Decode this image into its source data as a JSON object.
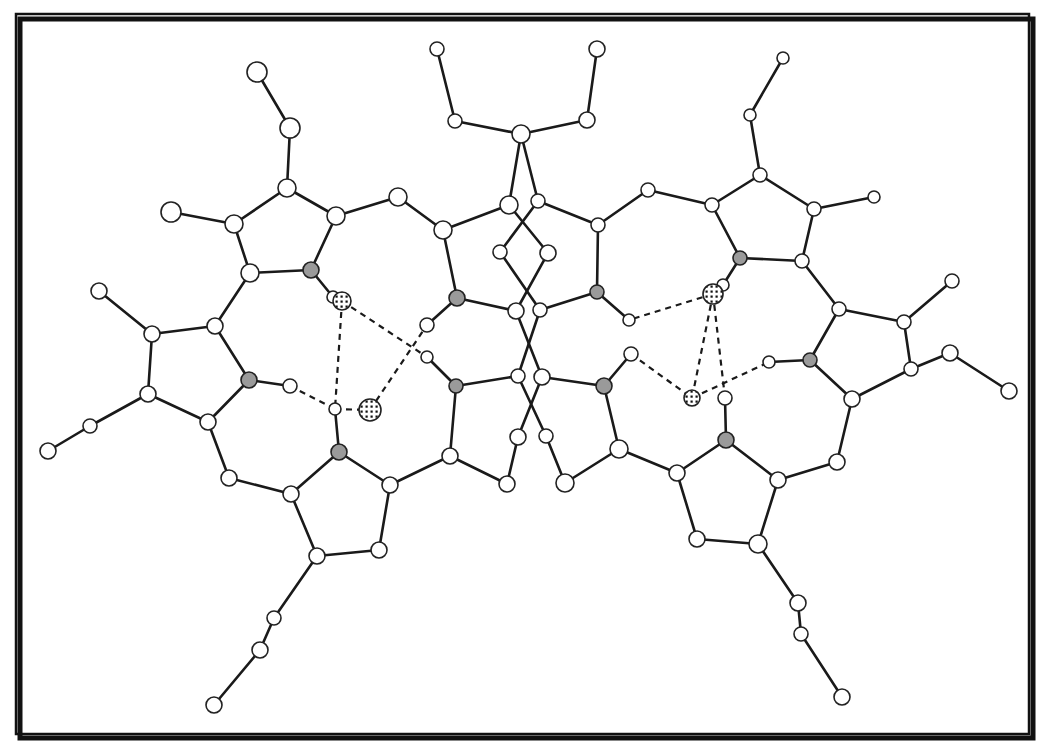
{
  "figure": {
    "title": "",
    "colors": {
      "bond": "#1a1a1a",
      "carbon_fill": "#ffffff",
      "nitrogen_fill": "#9a9a9a",
      "frame": "#111111"
    },
    "legend": {
      "carbon": "open circle",
      "nitrogen": "gray filled circle",
      "hydrogen": "small open circle",
      "oxygen": "stippled circle",
      "hydrogen_bond": "dashed line"
    }
  },
  "atoms": [
    {
      "id": "a1",
      "x": 257,
      "y": 72,
      "r": 10,
      "type": "c"
    },
    {
      "id": "a2",
      "x": 290,
      "y": 128,
      "r": 10,
      "type": "c"
    },
    {
      "id": "a3",
      "x": 287,
      "y": 188,
      "r": 9,
      "type": "c"
    },
    {
      "id": "a4",
      "x": 171,
      "y": 212,
      "r": 10,
      "type": "c"
    },
    {
      "id": "a5",
      "x": 234,
      "y": 224,
      "r": 9,
      "type": "c"
    },
    {
      "id": "a6",
      "x": 336,
      "y": 216,
      "r": 9,
      "type": "c"
    },
    {
      "id": "a7",
      "x": 250,
      "y": 273,
      "r": 9,
      "type": "c"
    },
    {
      "id": "a8",
      "x": 311,
      "y": 270,
      "r": 8,
      "type": "n"
    },
    {
      "id": "a9",
      "x": 398,
      "y": 197,
      "r": 9,
      "type": "c"
    },
    {
      "id": "a10",
      "x": 443,
      "y": 230,
      "r": 9,
      "type": "c"
    },
    {
      "id": "a11",
      "x": 99,
      "y": 291,
      "r": 8,
      "type": "c"
    },
    {
      "id": "a12",
      "x": 215,
      "y": 326,
      "r": 8,
      "type": "c"
    },
    {
      "id": "a13",
      "x": 152,
      "y": 334,
      "r": 8,
      "type": "c"
    },
    {
      "id": "a14",
      "x": 249,
      "y": 380,
      "r": 8,
      "type": "n"
    },
    {
      "id": "a15",
      "x": 148,
      "y": 394,
      "r": 8,
      "type": "c"
    },
    {
      "id": "a16",
      "x": 290,
      "y": 386,
      "r": 7,
      "type": "h"
    },
    {
      "id": "a17",
      "x": 208,
      "y": 422,
      "r": 8,
      "type": "c"
    },
    {
      "id": "a18",
      "x": 90,
      "y": 426,
      "r": 7,
      "type": "c"
    },
    {
      "id": "a19",
      "x": 48,
      "y": 451,
      "r": 8,
      "type": "c"
    },
    {
      "id": "a20",
      "x": 229,
      "y": 478,
      "r": 8,
      "type": "c"
    },
    {
      "id": "a21",
      "x": 291,
      "y": 494,
      "r": 8,
      "type": "c"
    },
    {
      "id": "a22",
      "x": 339,
      "y": 452,
      "r": 8,
      "type": "n"
    },
    {
      "id": "a23",
      "x": 390,
      "y": 485,
      "r": 8,
      "type": "c"
    },
    {
      "id": "a24",
      "x": 317,
      "y": 556,
      "r": 8,
      "type": "c"
    },
    {
      "id": "a25",
      "x": 379,
      "y": 550,
      "r": 8,
      "type": "c"
    },
    {
      "id": "a26",
      "x": 274,
      "y": 618,
      "r": 7,
      "type": "c"
    },
    {
      "id": "a27",
      "x": 260,
      "y": 650,
      "r": 8,
      "type": "c"
    },
    {
      "id": "a28",
      "x": 214,
      "y": 705,
      "r": 8,
      "type": "c"
    },
    {
      "id": "a29",
      "x": 333,
      "y": 297,
      "r": 6,
      "type": "h"
    },
    {
      "id": "a30",
      "x": 342,
      "y": 301,
      "r": 9,
      "type": "x"
    },
    {
      "id": "a31",
      "x": 335,
      "y": 409,
      "r": 6,
      "type": "h"
    },
    {
      "id": "a32",
      "x": 370,
      "y": 410,
      "r": 11,
      "type": "x"
    },
    {
      "id": "a33",
      "x": 427,
      "y": 325,
      "r": 7,
      "type": "h"
    },
    {
      "id": "a34",
      "x": 427,
      "y": 357,
      "r": 6,
      "type": "h"
    },
    {
      "id": "a35",
      "x": 457,
      "y": 298,
      "r": 8,
      "type": "n"
    },
    {
      "id": "a36",
      "x": 456,
      "y": 386,
      "r": 7,
      "type": "n"
    },
    {
      "id": "a37",
      "x": 450,
      "y": 456,
      "r": 8,
      "type": "c"
    },
    {
      "id": "a38",
      "x": 507,
      "y": 484,
      "r": 8,
      "type": "c"
    },
    {
      "id": "a39",
      "x": 437,
      "y": 49,
      "r": 7,
      "type": "c"
    },
    {
      "id": "a40",
      "x": 455,
      "y": 121,
      "r": 7,
      "type": "c"
    },
    {
      "id": "a41",
      "x": 521,
      "y": 134,
      "r": 9,
      "type": "c"
    },
    {
      "id": "a42",
      "x": 587,
      "y": 120,
      "r": 8,
      "type": "c"
    },
    {
      "id": "a43",
      "x": 597,
      "y": 49,
      "r": 8,
      "type": "c"
    },
    {
      "id": "a44",
      "x": 509,
      "y": 205,
      "r": 9,
      "type": "c"
    },
    {
      "id": "a45",
      "x": 538,
      "y": 201,
      "r": 7,
      "type": "c"
    },
    {
      "id": "a46",
      "x": 500,
      "y": 252,
      "r": 7,
      "type": "c"
    },
    {
      "id": "a47",
      "x": 548,
      "y": 253,
      "r": 8,
      "type": "c"
    },
    {
      "id": "a48",
      "x": 516,
      "y": 311,
      "r": 8,
      "type": "c"
    },
    {
      "id": "a49",
      "x": 540,
      "y": 310,
      "r": 7,
      "type": "c"
    },
    {
      "id": "a50",
      "x": 518,
      "y": 376,
      "r": 7,
      "type": "c"
    },
    {
      "id": "a51",
      "x": 542,
      "y": 377,
      "r": 8,
      "type": "c"
    },
    {
      "id": "a52",
      "x": 518,
      "y": 437,
      "r": 8,
      "type": "c"
    },
    {
      "id": "a53",
      "x": 546,
      "y": 436,
      "r": 7,
      "type": "c"
    },
    {
      "id": "a54",
      "x": 565,
      "y": 483,
      "r": 9,
      "type": "c"
    },
    {
      "id": "a55",
      "x": 598,
      "y": 225,
      "r": 7,
      "type": "c"
    },
    {
      "id": "a56",
      "x": 597,
      "y": 292,
      "r": 7,
      "type": "n"
    },
    {
      "id": "a57",
      "x": 629,
      "y": 320,
      "r": 6,
      "type": "h"
    },
    {
      "id": "a58",
      "x": 604,
      "y": 386,
      "r": 8,
      "type": "n"
    },
    {
      "id": "a59",
      "x": 631,
      "y": 354,
      "r": 7,
      "type": "h"
    },
    {
      "id": "a60",
      "x": 619,
      "y": 449,
      "r": 9,
      "type": "c"
    },
    {
      "id": "a61",
      "x": 648,
      "y": 190,
      "r": 7,
      "type": "c"
    },
    {
      "id": "a62",
      "x": 712,
      "y": 205,
      "r": 7,
      "type": "c"
    },
    {
      "id": "a63",
      "x": 740,
      "y": 258,
      "r": 7,
      "type": "n"
    },
    {
      "id": "a64",
      "x": 723,
      "y": 285,
      "r": 6,
      "type": "h"
    },
    {
      "id": "a65",
      "x": 713,
      "y": 294,
      "r": 10,
      "type": "x"
    },
    {
      "id": "a66",
      "x": 692,
      "y": 398,
      "r": 8,
      "type": "x"
    },
    {
      "id": "a67",
      "x": 725,
      "y": 398,
      "r": 7,
      "type": "h"
    },
    {
      "id": "a68",
      "x": 726,
      "y": 440,
      "r": 8,
      "type": "n"
    },
    {
      "id": "a69",
      "x": 769,
      "y": 362,
      "r": 6,
      "type": "h"
    },
    {
      "id": "a70",
      "x": 750,
      "y": 115,
      "r": 6,
      "type": "c"
    },
    {
      "id": "a71",
      "x": 783,
      "y": 58,
      "r": 6,
      "type": "c"
    },
    {
      "id": "a72",
      "x": 760,
      "y": 175,
      "r": 7,
      "type": "c"
    },
    {
      "id": "a73",
      "x": 814,
      "y": 209,
      "r": 7,
      "type": "c"
    },
    {
      "id": "a74",
      "x": 874,
      "y": 197,
      "r": 6,
      "type": "c"
    },
    {
      "id": "a75",
      "x": 802,
      "y": 261,
      "r": 7,
      "type": "c"
    },
    {
      "id": "a76",
      "x": 839,
      "y": 309,
      "r": 7,
      "type": "c"
    },
    {
      "id": "a77",
      "x": 952,
      "y": 281,
      "r": 7,
      "type": "c"
    },
    {
      "id": "a78",
      "x": 904,
      "y": 322,
      "r": 7,
      "type": "c"
    },
    {
      "id": "a79",
      "x": 810,
      "y": 360,
      "r": 7,
      "type": "n"
    },
    {
      "id": "a80",
      "x": 950,
      "y": 353,
      "r": 8,
      "type": "c"
    },
    {
      "id": "a81",
      "x": 911,
      "y": 369,
      "r": 7,
      "type": "c"
    },
    {
      "id": "a82",
      "x": 1009,
      "y": 391,
      "r": 8,
      "type": "c"
    },
    {
      "id": "a83",
      "x": 852,
      "y": 399,
      "r": 8,
      "type": "c"
    },
    {
      "id": "a84",
      "x": 837,
      "y": 462,
      "r": 8,
      "type": "c"
    },
    {
      "id": "a85",
      "x": 677,
      "y": 473,
      "r": 8,
      "type": "c"
    },
    {
      "id": "a86",
      "x": 778,
      "y": 480,
      "r": 8,
      "type": "c"
    },
    {
      "id": "a87",
      "x": 697,
      "y": 539,
      "r": 8,
      "type": "c"
    },
    {
      "id": "a88",
      "x": 758,
      "y": 544,
      "r": 9,
      "type": "c"
    },
    {
      "id": "a89",
      "x": 798,
      "y": 603,
      "r": 8,
      "type": "c"
    },
    {
      "id": "a90",
      "x": 801,
      "y": 634,
      "r": 7,
      "type": "c"
    },
    {
      "id": "a91",
      "x": 842,
      "y": 697,
      "r": 8,
      "type": "c"
    }
  ],
  "bonds": [
    [
      "a1",
      "a2"
    ],
    [
      "a2",
      "a3"
    ],
    [
      "a3",
      "a5"
    ],
    [
      "a3",
      "a6"
    ],
    [
      "a4",
      "a5"
    ],
    [
      "a5",
      "a7"
    ],
    [
      "a6",
      "a8"
    ],
    [
      "a7",
      "a8"
    ],
    [
      "a6",
      "a9"
    ],
    [
      "a9",
      "a10"
    ],
    [
      "a10",
      "a35"
    ],
    [
      "a8",
      "a29"
    ],
    [
      "a7",
      "a12"
    ],
    [
      "a11",
      "a13"
    ],
    [
      "a12",
      "a13"
    ],
    [
      "a13",
      "a15"
    ],
    [
      "a12",
      "a14"
    ],
    [
      "a14",
      "a17"
    ],
    [
      "a15",
      "a17"
    ],
    [
      "a15",
      "a18"
    ],
    [
      "a18",
      "a19"
    ],
    [
      "a14",
      "a16"
    ],
    [
      "a17",
      "a20"
    ],
    [
      "a20",
      "a21"
    ],
    [
      "a21",
      "a22"
    ],
    [
      "a22",
      "a23"
    ],
    [
      "a21",
      "a24"
    ],
    [
      "a24",
      "a25"
    ],
    [
      "a25",
      "a23"
    ],
    [
      "a24",
      "a26"
    ],
    [
      "a26",
      "a27"
    ],
    [
      "a27",
      "a28"
    ],
    [
      "a22",
      "a31"
    ],
    [
      "a23",
      "a37"
    ],
    [
      "a37",
      "a36"
    ],
    [
      "a36",
      "a34"
    ],
    [
      "a35",
      "a33"
    ],
    [
      "a35",
      "a48"
    ],
    [
      "a36",
      "a50"
    ],
    [
      "a37",
      "a38"
    ],
    [
      "a10",
      "a44"
    ],
    [
      "a39",
      "a40"
    ],
    [
      "a40",
      "a41"
    ],
    [
      "a41",
      "a42"
    ],
    [
      "a42",
      "a43"
    ],
    [
      "a41",
      "a44"
    ],
    [
      "a41",
      "a45"
    ],
    [
      "a44",
      "a47"
    ],
    [
      "a45",
      "a46"
    ],
    [
      "a46",
      "a49"
    ],
    [
      "a47",
      "a48"
    ],
    [
      "a48",
      "a51"
    ],
    [
      "a49",
      "a50"
    ],
    [
      "a50",
      "a53"
    ],
    [
      "a51",
      "a52"
    ],
    [
      "a52",
      "a38"
    ],
    [
      "a53",
      "a54"
    ],
    [
      "a45",
      "a55"
    ],
    [
      "a55",
      "a56"
    ],
    [
      "a56",
      "a49"
    ],
    [
      "a56",
      "a57"
    ],
    [
      "a51",
      "a58"
    ],
    [
      "a58",
      "a59"
    ],
    [
      "a58",
      "a60"
    ],
    [
      "a60",
      "a54"
    ],
    [
      "a55",
      "a61"
    ],
    [
      "a61",
      "a62"
    ],
    [
      "a62",
      "a63"
    ],
    [
      "a62",
      "a72"
    ],
    [
      "a72",
      "a70"
    ],
    [
      "a70",
      "a71"
    ],
    [
      "a72",
      "a73"
    ],
    [
      "a73",
      "a74"
    ],
    [
      "a73",
      "a75"
    ],
    [
      "a63",
      "a75"
    ],
    [
      "a63",
      "a64"
    ],
    [
      "a75",
      "a76"
    ],
    [
      "a76",
      "a78"
    ],
    [
      "a78",
      "a77"
    ],
    [
      "a78",
      "a81"
    ],
    [
      "a81",
      "a80"
    ],
    [
      "a80",
      "a82"
    ],
    [
      "a76",
      "a79"
    ],
    [
      "a79",
      "a83"
    ],
    [
      "a83",
      "a81"
    ],
    [
      "a79",
      "a69"
    ],
    [
      "a83",
      "a84"
    ],
    [
      "a84",
      "a86"
    ],
    [
      "a86",
      "a68"
    ],
    [
      "a68",
      "a67"
    ],
    [
      "a68",
      "a85"
    ],
    [
      "a85",
      "a60"
    ],
    [
      "a85",
      "a87"
    ],
    [
      "a87",
      "a88"
    ],
    [
      "a88",
      "a86"
    ],
    [
      "a88",
      "a89"
    ],
    [
      "a89",
      "a90"
    ],
    [
      "a90",
      "a91"
    ]
  ],
  "hbonds": [
    [
      "a30",
      "a31"
    ],
    [
      "a30",
      "a34"
    ],
    [
      "a16",
      "a31"
    ],
    [
      "a32",
      "a33"
    ],
    [
      "a31",
      "a32"
    ],
    [
      "a65",
      "a66"
    ],
    [
      "a65",
      "a57"
    ],
    [
      "a59",
      "a66"
    ],
    [
      "a66",
      "a69"
    ],
    [
      "a65",
      "a67"
    ]
  ]
}
